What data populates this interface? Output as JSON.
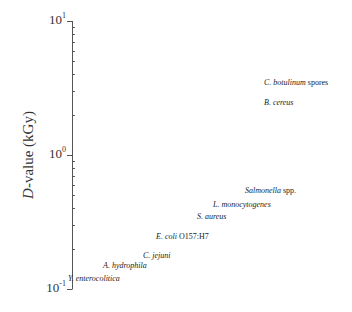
{
  "chart_data": {
    "type": "scatter",
    "title": "",
    "xlabel": "",
    "ylabel": "D-value (kGy)",
    "ylabel_parts": {
      "italic": "D",
      "rest": "-value (kGy)"
    },
    "yscale": "log",
    "ylim": [
      0.1,
      10
    ],
    "yticks": [
      {
        "base": "10",
        "exp": "1",
        "value": 10
      },
      {
        "base": "10",
        "exp": "0",
        "value": 1
      },
      {
        "base": "10",
        "exp": "-1",
        "value": 0.1
      }
    ],
    "grid": false,
    "legend": null,
    "points": [
      {
        "label": "C. botulinum",
        "suffix": " spores",
        "value": 3.5,
        "x": 264
      },
      {
        "label": "B. cereus",
        "suffix": "",
        "value": 2.5,
        "x": 264
      },
      {
        "label": "Salmonella",
        "suffix": " spp.",
        "value": 0.55,
        "x": 245
      },
      {
        "label": "L. monocytogenes",
        "suffix": "",
        "value": 0.43,
        "x": 213
      },
      {
        "label": "S. aureus",
        "suffix": "",
        "value": 0.35,
        "x": 197
      },
      {
        "label": "E. coli",
        "suffix": " O157:H7",
        "value": 0.25,
        "x": 156
      },
      {
        "label": "C. jejuni",
        "suffix": "",
        "value": 0.18,
        "x": 143
      },
      {
        "label": "A. hydrophila",
        "suffix": "",
        "value": 0.15,
        "x": 103
      },
      {
        "label": "Y. enterocolitica",
        "suffix": "",
        "value": 0.12,
        "x": 68
      }
    ]
  }
}
